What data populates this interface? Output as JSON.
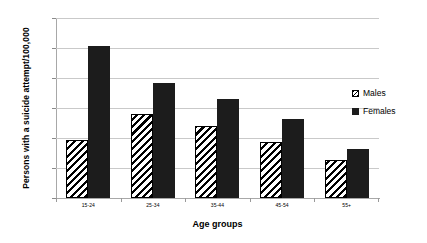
{
  "chart_data": {
    "type": "bar",
    "title": "",
    "xlabel": "Age groups",
    "ylabel": "Persons with a suicide attempt/100,000",
    "categories": [
      "15-24",
      "25-34",
      "35-44",
      "45-54",
      "55+"
    ],
    "series": [
      {
        "name": "Males",
        "values": [
          96,
          140,
          120,
          93,
          64
        ]
      },
      {
        "name": "Females",
        "values": [
          253,
          191,
          165,
          131,
          82
        ]
      }
    ],
    "ylim": [
      0,
      300
    ],
    "yticks": [
      0,
      50,
      100,
      150,
      200,
      250,
      300
    ],
    "ytick_labels": [
      "0",
      "50",
      "100",
      "150",
      "200",
      "250",
      "300"
    ],
    "grid": true,
    "legend_position": "right",
    "colors": {
      "males": "#ffffff",
      "males_hatch": "#000000",
      "females": "#1c1c1c",
      "gridline": "#c9c9c9",
      "axis": "#a8a8a8"
    }
  },
  "legend": {
    "items": [
      {
        "label": "Males",
        "style": "hatched"
      },
      {
        "label": "Females",
        "style": "solid"
      }
    ]
  }
}
